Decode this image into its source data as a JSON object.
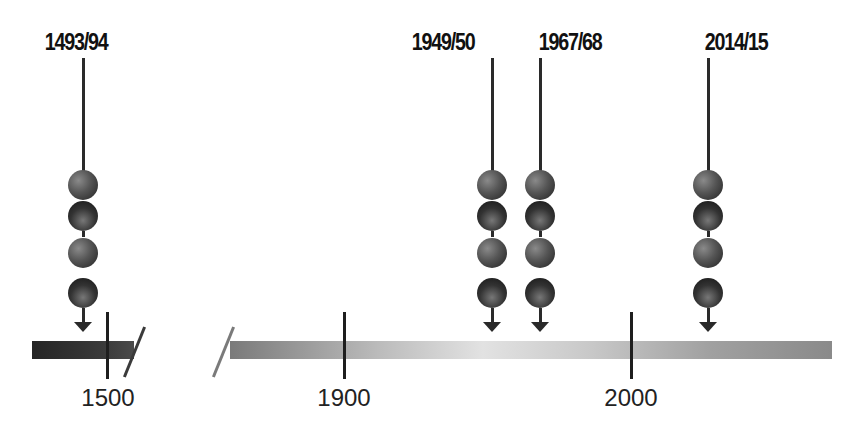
{
  "events": [
    {
      "label": "1493/94",
      "x": 83
    },
    {
      "label": "1949/50",
      "x": 492
    },
    {
      "label": "1967/68",
      "x": 540
    },
    {
      "label": "2014/15",
      "x": 708
    }
  ],
  "axis": {
    "ticks": [
      {
        "label": "1500",
        "x": 107
      },
      {
        "label": "1900",
        "x": 344
      },
      {
        "label": "2000",
        "x": 631
      }
    ],
    "break_between": [
      "1500",
      "1900"
    ]
  },
  "balls_per_event": 4,
  "colors": {
    "ink": "#2a2a2a",
    "bar_dark": "#2a2a2a",
    "bar_light": "#e2e2e2"
  }
}
